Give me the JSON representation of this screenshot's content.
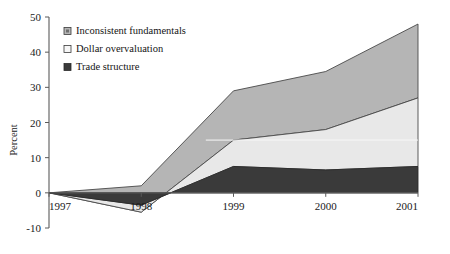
{
  "chart_data": {
    "type": "area",
    "title": "",
    "subtitle": "",
    "xlabel": "",
    "ylabel": "Percent",
    "categories": [
      "1997",
      "1998",
      "1999",
      "2000",
      "2001"
    ],
    "x": [
      1997,
      1998,
      1999,
      2000,
      2001
    ],
    "xlim": [
      1997,
      2001
    ],
    "ylim": [
      -10,
      50
    ],
    "yticks": [
      -10,
      0,
      10,
      20,
      30,
      40,
      50
    ],
    "ytick_labels": [
      "-10",
      "0",
      "10",
      "20",
      "30",
      "40",
      "50"
    ],
    "grid": false,
    "stacked": true,
    "legend_position": "top-left",
    "series": [
      {
        "name": "Trade structure",
        "color": "#3a3a3a",
        "values": [
          0,
          -3.5,
          7.5,
          6.5,
          7.5
        ]
      },
      {
        "name": "Dollar overvaluation",
        "color": "#e8e8e8",
        "values": [
          0,
          -2.0,
          7.5,
          11.5,
          19.5
        ]
      },
      {
        "name": "Inconsistent fundamentals",
        "color": "#b5b5b5",
        "values": [
          0,
          7.5,
          14.0,
          16.5,
          21.0
        ]
      }
    ],
    "cumulative_top_line": [
      0,
      2,
      29,
      34.5,
      48
    ],
    "cumulative_mid_line": [
      0,
      -5.5,
      15,
      18,
      27
    ],
    "cumulative_dark_line": [
      0,
      -3.5,
      7.5,
      6.5,
      7.5
    ]
  },
  "legend": {
    "items": [
      {
        "label": "Inconsistent fundamentals",
        "swatch": "medium-gray",
        "color": "#b5b5b5"
      },
      {
        "label": "Dollar overvaluation",
        "swatch": "light-gray",
        "color": "#f2f2f2"
      },
      {
        "label": "Trade structure",
        "swatch": "dark-gray",
        "color": "#3a3a3a"
      }
    ]
  },
  "axes": {
    "y_title": "Percent",
    "y_ticks": [
      "50",
      "40",
      "30",
      "20",
      "10",
      "0",
      "-10"
    ],
    "x_ticks": [
      "1997",
      "1998",
      "1999",
      "2000",
      "2001"
    ]
  },
  "colors": {
    "series_top": "#b5b5b5",
    "series_mid": "#e8e8e8",
    "series_bottom": "#3a3a3a",
    "axis": "#4a4a4a",
    "outline": "#333333",
    "background": "#ffffff"
  }
}
